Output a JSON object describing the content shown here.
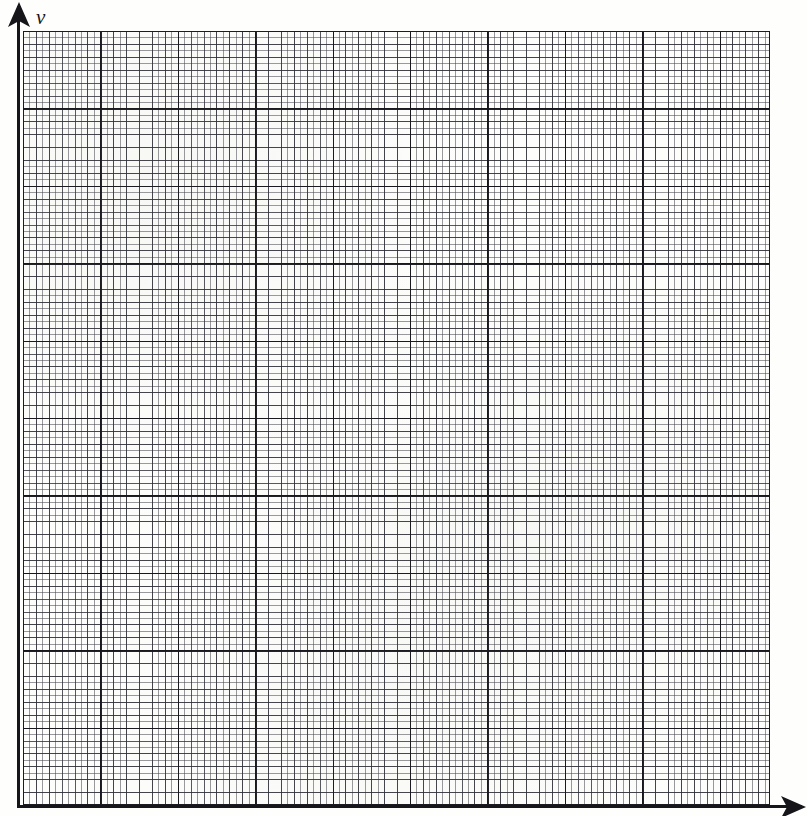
{
  "figure": {
    "kind": "blank-graph-paper"
  },
  "axes": {
    "y": {
      "label": "v",
      "label_style": "italic",
      "arrowhead": "up",
      "line_color": "#15151a",
      "x_px": 17,
      "top_px": 6,
      "bottom_px": 807
    },
    "x": {
      "label": "",
      "arrowhead": "right",
      "line_color": "#15151a",
      "y_px": 805,
      "left_px": 17,
      "right_px": 802
    }
  },
  "grid": {
    "left_px": 23,
    "top_px": 31,
    "right_px": 770,
    "bottom_px": 805,
    "width_px": 747,
    "height_px": 774,
    "minor_spacing_px": 6.45,
    "medium_spacing_px": 12.9,
    "major_spacing_px": 77.4,
    "minor_cells_x": 116,
    "minor_cells_y": 120,
    "major_cells_x": 9.65,
    "major_cells_y": 10,
    "minor_color": "#464650",
    "medium_color": "#2d2d37",
    "major_color": "#14141a",
    "background_color": "#fdfdfb",
    "border_color": "#1b1b22"
  },
  "chart_data": {
    "type": "line",
    "title": "",
    "xlabel": "",
    "ylabel": "v",
    "categories": [],
    "series": [],
    "values": [],
    "annotations": [],
    "legend": [],
    "grid": true,
    "xlim": [
      0,
      0
    ],
    "ylim": [
      0,
      0
    ],
    "note": "Empty answer grid - no data plotted"
  }
}
